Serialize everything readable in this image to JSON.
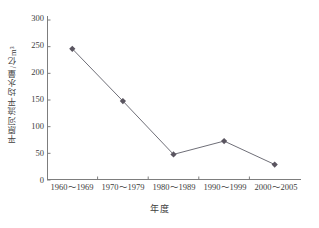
{
  "chart_data": {
    "type": "line",
    "title": "",
    "xlabel": "年度",
    "ylabel": "平原河流平均水量/亿m³",
    "categories": [
      "1960～1969",
      "1970～1979",
      "1980～1989",
      "1990～1999",
      "2000～2005"
    ],
    "values": [
      246,
      148,
      48,
      73,
      29
    ],
    "series": [
      {
        "name": "平原河流平均水量",
        "values": [
          246,
          148,
          48,
          73,
          29
        ]
      }
    ],
    "ylim": [
      0,
      300
    ],
    "yticks": [
      0,
      50,
      100,
      150,
      200,
      250,
      300
    ],
    "ytick_labels": [
      "0",
      "50",
      "100",
      "150",
      "200",
      "250",
      "300"
    ],
    "grid": false,
    "legend": "none",
    "marker": "diamond",
    "line_color": "#6f6f78",
    "marker_color": "#5a5560",
    "axis_color": "#7d7d7d",
    "background": "#ffffff"
  }
}
